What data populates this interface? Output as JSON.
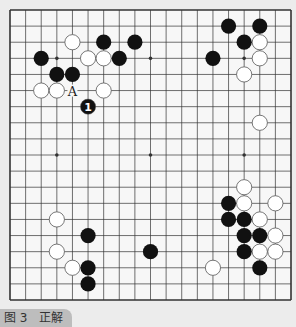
{
  "figure": {
    "caption": "图 3　正解",
    "board_size": 19,
    "colors": {
      "background": "#ececec",
      "board": "#f7f7f7",
      "line": "#333333",
      "black": "#111111",
      "white": "#ffffff",
      "caption_bg": "#bdbdbd"
    },
    "star_points": [
      [
        3,
        3
      ],
      [
        9,
        3
      ],
      [
        15,
        3
      ],
      [
        3,
        9
      ],
      [
        9,
        9
      ],
      [
        15,
        9
      ],
      [
        3,
        15
      ],
      [
        9,
        15
      ],
      [
        15,
        15
      ]
    ],
    "black_stones": [
      [
        6,
        2
      ],
      [
        8,
        2
      ],
      [
        2,
        3
      ],
      [
        7,
        3
      ],
      [
        3,
        4
      ],
      [
        4,
        4
      ],
      [
        14,
        1
      ],
      [
        16,
        1
      ],
      [
        15,
        2
      ],
      [
        13,
        3
      ],
      [
        5,
        14
      ],
      [
        9,
        15
      ],
      [
        5,
        16
      ],
      [
        5,
        17
      ],
      [
        14,
        12
      ],
      [
        14,
        13
      ],
      [
        15,
        13
      ],
      [
        15,
        14
      ],
      [
        16,
        14
      ],
      [
        15,
        15
      ],
      [
        16,
        16
      ]
    ],
    "white_stones": [
      [
        4,
        2
      ],
      [
        5,
        3
      ],
      [
        6,
        3
      ],
      [
        2,
        5
      ],
      [
        3,
        5
      ],
      [
        6,
        5
      ],
      [
        16,
        2
      ],
      [
        16,
        3
      ],
      [
        15,
        4
      ],
      [
        16,
        7
      ],
      [
        3,
        13
      ],
      [
        3,
        15
      ],
      [
        4,
        16
      ],
      [
        15,
        11
      ],
      [
        15,
        12
      ],
      [
        17,
        12
      ],
      [
        16,
        13
      ],
      [
        17,
        14
      ],
      [
        16,
        15
      ],
      [
        17,
        15
      ],
      [
        13,
        16
      ]
    ],
    "numbered_stones": [
      {
        "col": 5,
        "row": 6,
        "color": "black",
        "label": "1"
      }
    ],
    "labels": [
      {
        "col": 4,
        "row": 5,
        "text": "A"
      }
    ]
  }
}
